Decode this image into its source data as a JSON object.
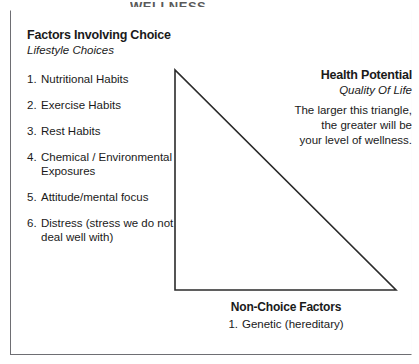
{
  "page": {
    "top_header_text": "WELLNESS",
    "background_color": "#ffffff",
    "line_color": "#2b2b2b",
    "frame_color": "#6e6e73"
  },
  "left_panel": {
    "title": "Factors Involving Choice",
    "subtitle": "Lifestyle Choices",
    "items": [
      {
        "number": "1.",
        "label": "Nutritional Habits"
      },
      {
        "number": "2.",
        "label": "Exercise Habits"
      },
      {
        "number": "3.",
        "label": "Rest Habits"
      },
      {
        "number": "4.",
        "label": "Chemical / Environmental Exposures"
      },
      {
        "number": "5.",
        "label": "Attitude/mental focus"
      },
      {
        "number": "6.",
        "label": "Distress (stress we do not deal well with)"
      }
    ]
  },
  "right_panel": {
    "title": "Health Potential",
    "subtitle": "Quality Of Life",
    "body_lines": [
      "The larger this triangle,",
      "the greater will be",
      "your level of wellness."
    ]
  },
  "bottom_panel": {
    "title": "Non-Choice Factors",
    "items": [
      {
        "number": "1.",
        "label": "Genetic (hereditary)"
      }
    ]
  },
  "diagram": {
    "shape": "right-triangle",
    "apex": {
      "x": 175,
      "y": 70
    },
    "bottom_left": {
      "x": 175,
      "y": 290
    },
    "bottom_right": {
      "x": 396,
      "y": 290
    },
    "stroke_width": 1.6
  }
}
